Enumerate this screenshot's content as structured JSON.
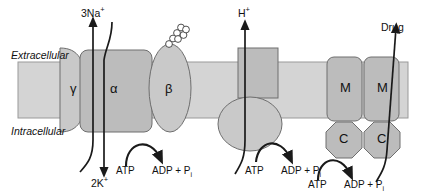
{
  "figure": {
    "type": "diagram",
    "membrane": {
      "extracellular_label": "Extracellular",
      "intracellular_label": "Intracellular",
      "fill": "#d4d4d4",
      "stroke": "#9a9a9a",
      "top_y": 62,
      "bottom_y": 118
    },
    "colors": {
      "protein_fill": "#bcbcbc",
      "protein_fill_light": "#c9c9c9",
      "protein_stroke": "#6e6e6e",
      "arrow": "#1a1a1a",
      "text": "#111111",
      "background": "#ffffff"
    }
  },
  "pumps": [
    {
      "id": "na-k-atpase",
      "name": "Na+/K+-ATPase",
      "transported_out_label": "3Na",
      "transported_out_charge": "+",
      "transported_in_label": "2K",
      "transported_in_charge": "+",
      "subunits": [
        {
          "symbol": "γ",
          "name": "gamma-subunit"
        },
        {
          "symbol": "α",
          "name": "alpha-subunit"
        },
        {
          "symbol": "β",
          "name": "beta-subunit"
        }
      ],
      "glycosylation": {
        "name": "oligosaccharide-chain",
        "units": 7
      },
      "energy": {
        "substrate": "ATP",
        "products": "ADP + P",
        "products_subscript": "i"
      }
    },
    {
      "id": "h-atpase",
      "name": "H+-ATPase",
      "transported_out_label": "H",
      "transported_out_charge": "+",
      "energy": {
        "substrate": "ATP",
        "products": "ADP + P",
        "products_subscript": "i"
      }
    },
    {
      "id": "abc-drug-transporter",
      "name": "ABC drug transporter",
      "transported_out_label": "Drug",
      "subunits": [
        {
          "symbol": "M",
          "name": "membrane-domain-1"
        },
        {
          "symbol": "M",
          "name": "membrane-domain-2"
        },
        {
          "symbol": "C",
          "name": "catalytic-domain-1"
        },
        {
          "symbol": "C",
          "name": "catalytic-domain-2"
        }
      ],
      "energy": {
        "substrate": "ATP",
        "products": "ADP + P",
        "products_subscript": "i"
      }
    }
  ],
  "labels": {
    "extracellular": "Extracellular",
    "intracellular": "Intracellular",
    "na_out": "3Na",
    "na_sup": "+",
    "k_in": "2K",
    "k_sup": "+",
    "h_out": "H",
    "h_sup": "+",
    "drug_out": "Drug",
    "atp_1": "ATP",
    "adp_1": "ADP + P",
    "adp_1_sub": "i",
    "atp_2": "ATP",
    "adp_2": "ADP + P",
    "adp_2_sub": "i",
    "atp_3": "ATP",
    "adp_3": "ADP + P",
    "adp_3_sub": "i",
    "gamma": "γ",
    "alpha": "α",
    "beta": "β",
    "m_left": "M",
    "m_right": "M",
    "c_left": "C",
    "c_right": "C"
  }
}
